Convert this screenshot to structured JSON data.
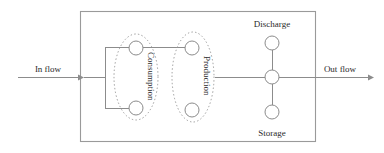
{
  "figure": {
    "type": "block-flow-diagram",
    "background_color": "#ffffff",
    "stroke_color": "#8c8c8c",
    "text_color": "#2b2b2b"
  },
  "labels": {
    "in_flow": "In flow",
    "out_flow": "Out flow",
    "consumption": "Consumption",
    "production": "Production",
    "discharge": "Discharge",
    "storage": "Storage"
  },
  "diagram_data": {
    "type": "diagram",
    "system_boundary": {
      "name": "system-boundary-box",
      "x": 80,
      "y": 11,
      "width": 236,
      "height": 131
    },
    "groups": [
      {
        "name": "consumption-group",
        "label": "Consumption",
        "label_rotation_deg": 90,
        "outline": "dotted-ellipse",
        "cx": 136,
        "cy": 77,
        "rx": 22,
        "ry": 43,
        "nodes": [
          "consumption-node-top",
          "consumption-node-bottom"
        ]
      },
      {
        "name": "production-group",
        "label": "Production",
        "label_rotation_deg": 90,
        "outline": "dotted-ellipse",
        "cx": 193,
        "cy": 77,
        "rx": 21,
        "ry": 45,
        "nodes": [
          "production-node-top",
          "production-node-bottom"
        ]
      }
    ],
    "nodes": [
      {
        "name": "consumption-node-top",
        "cx": 136,
        "cy": 48,
        "r": 7
      },
      {
        "name": "consumption-node-bottom",
        "cx": 136,
        "cy": 108,
        "r": 7
      },
      {
        "name": "production-node-top",
        "cx": 192,
        "cy": 48,
        "r": 7
      },
      {
        "name": "production-node-bottom",
        "cx": 192,
        "cy": 110,
        "r": 7
      },
      {
        "name": "discharge-node",
        "cx": 272,
        "cy": 43,
        "r": 7,
        "label": "Discharge"
      },
      {
        "name": "junction-node",
        "cx": 272,
        "cy": 77,
        "r": 7
      },
      {
        "name": "storage-node",
        "cx": 272,
        "cy": 112,
        "r": 7,
        "label": "Storage"
      }
    ],
    "edges": [
      {
        "name": "in-flow-arrow",
        "from": "in-flow-source",
        "to": "system-boundary-box",
        "x1": 18,
        "y1": 77,
        "x2": 82,
        "y2": 77,
        "arrow": "end"
      },
      {
        "name": "in-flow-to-bracket",
        "x1": 82,
        "y1": 77,
        "x2": 105,
        "y2": 77
      },
      {
        "name": "bracket-vertical",
        "x1": 105,
        "y1": 48,
        "x2": 105,
        "y2": 108
      },
      {
        "name": "bracket-top-stub",
        "x1": 105,
        "y1": 48,
        "x2": 129,
        "y2": 48
      },
      {
        "name": "bracket-bottom-stub",
        "x1": 105,
        "y1": 108,
        "x2": 129,
        "y2": 108
      },
      {
        "name": "consumption-to-production-top",
        "x1": 143,
        "y1": 48,
        "x2": 185,
        "y2": 48
      },
      {
        "name": "production-to-junction",
        "x1": 215,
        "y1": 77,
        "x2": 265,
        "y2": 77
      },
      {
        "name": "discharge-link",
        "x1": 272,
        "y1": 50,
        "x2": 272,
        "y2": 70
      },
      {
        "name": "storage-link",
        "x1": 272,
        "y1": 84,
        "x2": 272,
        "y2": 105
      },
      {
        "name": "out-flow-arrow",
        "from": "junction-node",
        "to": "out-flow-sink",
        "x1": 279,
        "y1": 77,
        "x2": 372,
        "y2": 77,
        "arrow": "end"
      }
    ],
    "label_positions": {
      "in_flow": {
        "x": 48,
        "y": 72,
        "anchor": "middle"
      },
      "out_flow": {
        "x": 340,
        "y": 72,
        "anchor": "middle"
      },
      "discharge": {
        "x": 272,
        "y": 27,
        "anchor": "middle"
      },
      "storage": {
        "x": 272,
        "y": 135,
        "anchor": "middle"
      },
      "consumption": {
        "x": 148,
        "y": 52,
        "anchor": "start",
        "rotate": 90
      },
      "production": {
        "x": 204,
        "y": 54,
        "anchor": "start",
        "rotate": 90
      }
    }
  }
}
